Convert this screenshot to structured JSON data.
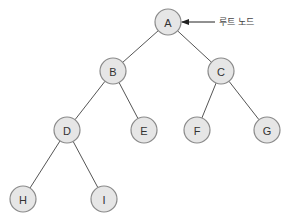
{
  "diagram": {
    "type": "binary-tree",
    "node_radius": 13,
    "colors": {
      "node_fill": "#e6e6e6",
      "node_stroke": "#8a8a8a",
      "edge": "#555555",
      "text": "#333333"
    },
    "nodes": [
      {
        "id": "A",
        "label": "A",
        "x": 168,
        "y": 22
      },
      {
        "id": "B",
        "label": "B",
        "x": 113,
        "y": 71
      },
      {
        "id": "C",
        "label": "C",
        "x": 221,
        "y": 71
      },
      {
        "id": "D",
        "label": "D",
        "x": 67,
        "y": 130
      },
      {
        "id": "E",
        "label": "E",
        "x": 144,
        "y": 130
      },
      {
        "id": "F",
        "label": "F",
        "x": 197,
        "y": 130
      },
      {
        "id": "G",
        "label": "G",
        "x": 267,
        "y": 130
      },
      {
        "id": "H",
        "label": "H",
        "x": 23,
        "y": 199
      },
      {
        "id": "I",
        "label": "I",
        "x": 104,
        "y": 199
      }
    ],
    "edges": [
      [
        "A",
        "B"
      ],
      [
        "A",
        "C"
      ],
      [
        "B",
        "D"
      ],
      [
        "B",
        "E"
      ],
      [
        "C",
        "F"
      ],
      [
        "C",
        "G"
      ],
      [
        "D",
        "H"
      ],
      [
        "D",
        "I"
      ]
    ],
    "annotation": {
      "label": "루트 노드",
      "target": "A",
      "arrow_from": {
        "x": 215,
        "y": 22
      },
      "arrow_to": {
        "x": 182,
        "y": 22
      },
      "text_x": 219,
      "text_y": 22
    }
  }
}
